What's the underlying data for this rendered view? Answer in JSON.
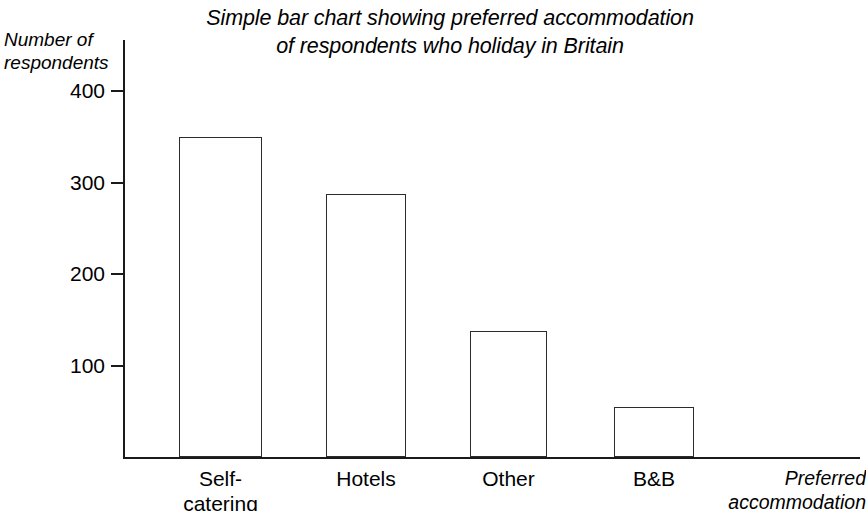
{
  "chart_data": {
    "type": "bar",
    "title": "Simple bar chart showing preferred accommodation\nof respondents who holiday in Britain",
    "categories": [
      "Self-\ncatering",
      "Hotels",
      "Other",
      "B&B"
    ],
    "values": [
      350,
      287,
      138,
      55
    ],
    "xlabel": "Preferred\naccommodation",
    "ylabel": "Number of\nrespondents",
    "ylim": [
      0,
      440
    ],
    "yticks": [
      100,
      200,
      300,
      400
    ],
    "ytick_labels": [
      "100",
      "200",
      "300",
      "400"
    ],
    "grid": false,
    "legend": false,
    "bar_fill": "#ffffff",
    "bar_stroke": "#2b2b2b",
    "axis_color": "#1a1a1a",
    "background": "#ffffff"
  }
}
